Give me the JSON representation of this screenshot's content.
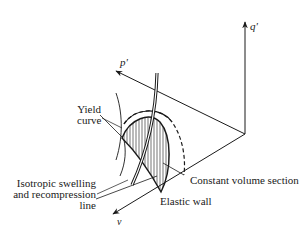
{
  "figure": {
    "type": "3D state boundary surface sketch",
    "axes": {
      "q": "q'",
      "p": "p'",
      "v": "v"
    },
    "labels": {
      "yield_curve_line1": "Yield",
      "yield_curve_line2": "curve",
      "iso_line1": "Isotropic swelling",
      "iso_line2": "and recompression",
      "iso_line3": "line",
      "constant_volume": "Constant volume section",
      "elastic_wall": "Elastic wall"
    },
    "colors": {
      "ink": "#1a1a1a",
      "background": "#ffffff"
    }
  }
}
